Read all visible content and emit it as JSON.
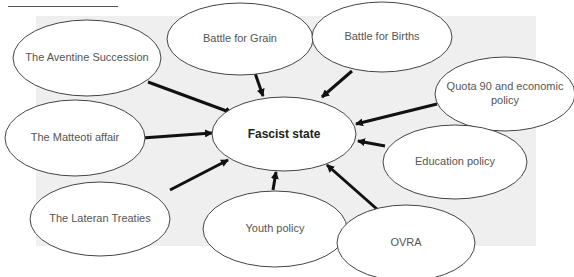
{
  "diagram": {
    "center": {
      "label": "Fascist state"
    },
    "nodes": [
      {
        "id": "aventine",
        "label": "The Aventine Succession"
      },
      {
        "id": "grain",
        "label": "Battle for Grain"
      },
      {
        "id": "births",
        "label": "Battle for Births"
      },
      {
        "id": "quota",
        "label": "Quota 90 and economic policy"
      },
      {
        "id": "matteoti",
        "label": "The Matteoti affair"
      },
      {
        "id": "education",
        "label": "Education policy"
      },
      {
        "id": "lateran",
        "label": "The Lateran Treaties"
      },
      {
        "id": "youth",
        "label": "Youth policy"
      },
      {
        "id": "ovra",
        "label": "OVRA"
      }
    ],
    "edges": [
      {
        "from": "aventine",
        "to": "center"
      },
      {
        "from": "grain",
        "to": "center"
      },
      {
        "from": "births",
        "to": "center"
      },
      {
        "from": "quota",
        "to": "center"
      },
      {
        "from": "matteoti",
        "to": "center"
      },
      {
        "from": "education",
        "to": "center"
      },
      {
        "from": "lateran",
        "to": "center"
      },
      {
        "from": "youth",
        "to": "center"
      },
      {
        "from": "ovra",
        "to": "center"
      }
    ]
  }
}
